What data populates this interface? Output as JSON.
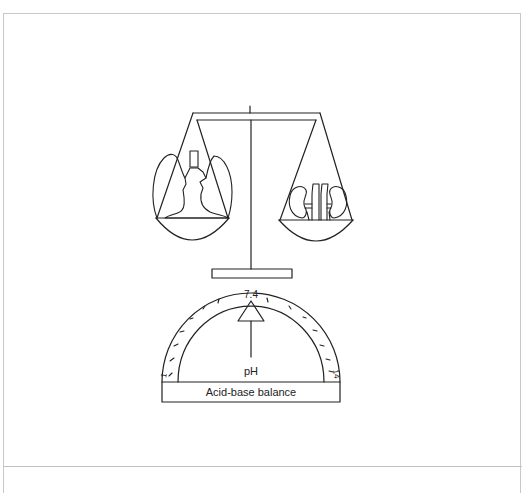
{
  "figure": {
    "gauge": {
      "quantity_label": "pH",
      "pointer_value": "7.4",
      "scale_min": "1",
      "scale_max": "14",
      "caption": "Acid-base balance"
    },
    "scale": {
      "left_pan_organ": "lungs",
      "right_pan_organ": "kidneys"
    }
  },
  "colors": {
    "line": "#222222",
    "frame": "#c8c8c8",
    "background": "#ffffff"
  }
}
